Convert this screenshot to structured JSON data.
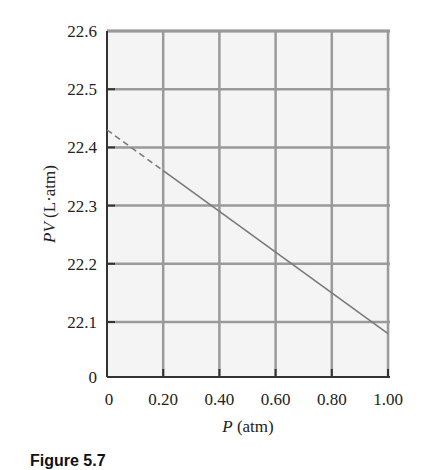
{
  "chart_data": {
    "type": "line",
    "title": "",
    "xlabel": "P (atm)",
    "xlabel_var": "P",
    "xlabel_unit": "(atm)",
    "ylabel": "PV (L·atm)",
    "ylabel_var": "PV",
    "ylabel_unit": "(L·atm)",
    "x_ticks": [
      "0",
      "0.20",
      "0.40",
      "0.60",
      "0.80",
      "1.00"
    ],
    "y_ticks": [
      "0",
      "22.1",
      "22.2",
      "22.3",
      "22.4",
      "22.5",
      "22.6"
    ],
    "xlim": [
      0,
      1.0
    ],
    "ylim": [
      22.0,
      22.6
    ],
    "y_axis_break": true,
    "grid": true,
    "series": [
      {
        "name": "extrapolated",
        "style": "dashed",
        "x": [
          0,
          0.2
        ],
        "y": [
          22.43,
          22.36
        ]
      },
      {
        "name": "measured",
        "style": "solid",
        "x": [
          0.2,
          1.0
        ],
        "y": [
          22.36,
          22.08
        ]
      }
    ],
    "caption": "Figure 5.7"
  },
  "colors": {
    "grid": "#9a9a9a",
    "plot_bg": "#f4f4f4",
    "line": "#7a7a7a",
    "axis": "#333333"
  }
}
